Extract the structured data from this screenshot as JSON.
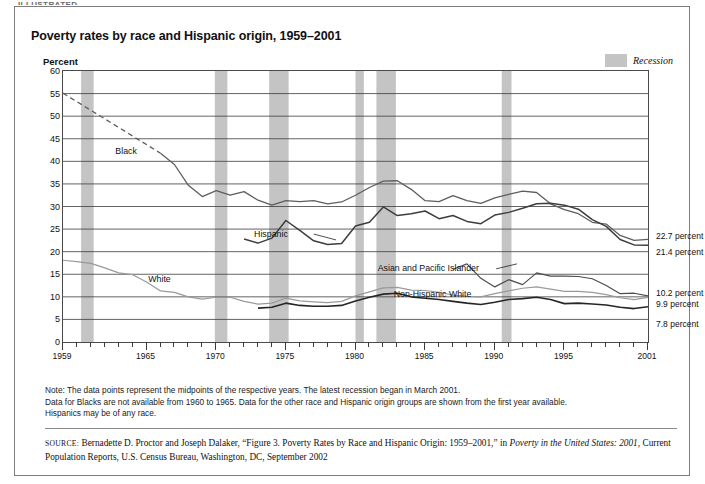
{
  "page": {
    "cut_top_text": "ILLUSTRATED",
    "title": "Poverty rates by race and Hispanic origin, 1959–2001"
  },
  "legend": {
    "recession_label": "Recession",
    "recession_color": "#c4c4c4"
  },
  "notes": {
    "line1": "Note:  The data points represent the midpoints of the respective years.  The latest recession began in March 2001.",
    "line2": "Data for Blacks are not available from 1960 to 1965.  Data for the other race and Hispanic origin groups are shown from the first year available.",
    "line3": "Hispanics may be of any race."
  },
  "source": {
    "label": "SOURCE:",
    "text_1": " Bernadette D. Proctor and Joseph Dalaker, “Figure 3. Poverty Rates by Race and Hispanic Origin: 1959–2001,” in ",
    "italic_1": "Poverty in the United States: 2001",
    "text_2": ", Current Population Reports, U.S. Census Bureau, Washington, DC, September 2002"
  },
  "chart_data": {
    "type": "line",
    "title": "Poverty rates by race and Hispanic origin, 1959–2001",
    "xlabel": "",
    "ylabel": "Percent",
    "ylim": [
      0,
      60
    ],
    "xlim": [
      1959,
      2001
    ],
    "yticks": [
      0,
      5,
      10,
      15,
      20,
      25,
      30,
      35,
      40,
      45,
      50,
      55,
      60
    ],
    "xticks": [
      1959,
      1965,
      1970,
      1975,
      1980,
      1985,
      1990,
      1995,
      2001
    ],
    "xtick_labels": [
      "1959",
      "1965",
      "1970",
      "1975",
      "1980",
      "1985",
      "1990",
      "1995",
      "2001"
    ],
    "grid": true,
    "legend_position": "in-plot-annotations",
    "recession_bands": [
      [
        1960.3,
        1961.2
      ],
      [
        1969.9,
        1970.8
      ],
      [
        1973.8,
        1975.2
      ],
      [
        1980.0,
        1980.6
      ],
      [
        1981.5,
        1982.9
      ],
      [
        1990.5,
        1991.2
      ],
      [
        2001.2,
        2001.5
      ]
    ],
    "end_value_labels": [
      {
        "series": "Black",
        "value": 22.7,
        "text": "22.7 percent"
      },
      {
        "series": "Hispanic",
        "value": 21.4,
        "text": "21.4 percent"
      },
      {
        "series": "Asian and Pacific Islander",
        "value": 10.2,
        "text": "10.2 percent"
      },
      {
        "series": "White",
        "value": 9.9,
        "text": "9.9 percent"
      },
      {
        "series": "Non-Hispanic White",
        "value": 7.8,
        "text": "7.8 percent"
      }
    ],
    "annotations": [
      {
        "text": "Black",
        "x": 1963.6,
        "y": 42.0
      },
      {
        "text": "Hispanic",
        "x": 1974.0,
        "y": 23.8
      },
      {
        "text": "White",
        "x": 1966.0,
        "y": 13.8
      },
      {
        "text": "Asian and Pacific Islander",
        "x": 1985.3,
        "y": 16.2
      },
      {
        "text": "Non-Hispanic White",
        "x": 1985.6,
        "y": 10.4
      }
    ],
    "series": [
      {
        "name": "Black",
        "color": "#5e5e5e",
        "width": 1.3,
        "dashed_segment": {
          "from": 1959,
          "to": 1966,
          "note": "Data for Blacks are not available from 1960 to 1965"
        },
        "x": [
          1959,
          1966,
          1967,
          1968,
          1969,
          1970,
          1971,
          1972,
          1973,
          1974,
          1975,
          1976,
          1977,
          1978,
          1979,
          1980,
          1981,
          1982,
          1983,
          1984,
          1985,
          1986,
          1987,
          1988,
          1989,
          1990,
          1991,
          1992,
          1993,
          1994,
          1995,
          1996,
          1997,
          1998,
          1999,
          2000,
          2001
        ],
        "y": [
          55.1,
          41.8,
          39.3,
          34.7,
          32.2,
          33.5,
          32.5,
          33.3,
          31.4,
          30.3,
          31.3,
          31.1,
          31.3,
          30.6,
          31.0,
          32.5,
          34.2,
          35.6,
          35.7,
          33.8,
          31.3,
          31.1,
          32.4,
          31.3,
          30.7,
          31.9,
          32.7,
          33.4,
          33.1,
          30.6,
          29.3,
          28.4,
          26.5,
          26.1,
          23.6,
          22.5,
          22.7
        ]
      },
      {
        "name": "Hispanic",
        "color": "#3d3d3d",
        "width": 1.5,
        "x": [
          1972,
          1973,
          1974,
          1975,
          1976,
          1977,
          1978,
          1979,
          1980,
          1981,
          1982,
          1983,
          1984,
          1985,
          1986,
          1987,
          1988,
          1989,
          1990,
          1991,
          1992,
          1993,
          1994,
          1995,
          1996,
          1997,
          1998,
          1999,
          2000,
          2001
        ],
        "y": [
          22.8,
          21.9,
          23.0,
          26.9,
          24.7,
          22.4,
          21.6,
          21.8,
          25.7,
          26.5,
          29.9,
          28.0,
          28.4,
          29.0,
          27.3,
          28.0,
          26.7,
          26.2,
          28.1,
          28.7,
          29.6,
          30.6,
          30.7,
          30.3,
          29.4,
          27.1,
          25.6,
          22.7,
          21.5,
          21.4
        ]
      },
      {
        "name": "Asian and Pacific Islander",
        "color": "#4d4d4d",
        "width": 1.2,
        "x": [
          1987,
          1988,
          1989,
          1990,
          1991,
          1992,
          1993,
          1994,
          1995,
          1996,
          1997,
          1998,
          1999,
          2000,
          2001
        ],
        "y": [
          16.1,
          17.3,
          14.1,
          12.2,
          13.8,
          12.7,
          15.3,
          14.6,
          14.6,
          14.5,
          14.0,
          12.5,
          10.7,
          10.8,
          10.2
        ]
      },
      {
        "name": "White",
        "color": "#9a9a9a",
        "width": 1.2,
        "x": [
          1959,
          1960,
          1961,
          1962,
          1963,
          1964,
          1965,
          1966,
          1967,
          1968,
          1969,
          1970,
          1971,
          1972,
          1973,
          1974,
          1975,
          1976,
          1977,
          1978,
          1979,
          1980,
          1981,
          1982,
          1983,
          1984,
          1985,
          1986,
          1987,
          1988,
          1989,
          1990,
          1991,
          1992,
          1993,
          1994,
          1995,
          1996,
          1997,
          1998,
          1999,
          2000,
          2001
        ],
        "y": [
          18.1,
          17.8,
          17.4,
          16.4,
          15.3,
          14.9,
          13.3,
          11.3,
          11.0,
          10.0,
          9.5,
          9.9,
          9.9,
          9.0,
          8.4,
          8.6,
          9.7,
          9.1,
          8.9,
          8.7,
          9.0,
          10.2,
          11.1,
          12.0,
          12.1,
          11.5,
          11.4,
          11.0,
          10.4,
          10.1,
          10.0,
          10.7,
          11.3,
          11.9,
          12.2,
          11.7,
          11.2,
          11.2,
          11.0,
          10.5,
          9.8,
          9.4,
          9.9
        ]
      },
      {
        "name": "Non-Hispanic White",
        "color": "#262626",
        "width": 1.6,
        "x": [
          1973,
          1974,
          1975,
          1976,
          1977,
          1978,
          1979,
          1980,
          1981,
          1982,
          1983,
          1984,
          1985,
          1986,
          1987,
          1988,
          1989,
          1990,
          1991,
          1992,
          1993,
          1994,
          1995,
          1996,
          1997,
          1998,
          1999,
          2000,
          2001
        ],
        "y": [
          7.5,
          7.7,
          8.6,
          8.1,
          7.9,
          7.9,
          8.1,
          9.1,
          9.9,
          10.6,
          10.8,
          10.0,
          9.7,
          9.4,
          9.0,
          8.6,
          8.3,
          8.8,
          9.4,
          9.6,
          9.9,
          9.4,
          8.5,
          8.6,
          8.4,
          8.2,
          7.7,
          7.4,
          7.8
        ]
      }
    ]
  }
}
